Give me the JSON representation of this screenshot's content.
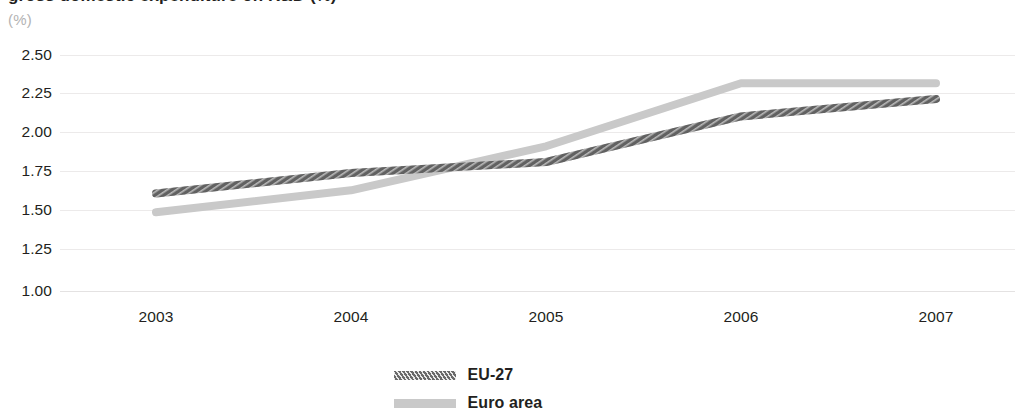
{
  "chart_data": {
    "type": "line",
    "title": "",
    "subtitle": "",
    "unit_label": "(%)",
    "xlabel": "",
    "ylabel": "",
    "categories": [
      "2003",
      "2004",
      "2005",
      "2006",
      "2007"
    ],
    "x_tick_labels": [
      "2003",
      "2004",
      "2005",
      "2006",
      "2007"
    ],
    "y_tick_labels": [
      "2.50",
      "2.25",
      "2.00",
      "1.75",
      "1.50",
      "1.25",
      "1.00"
    ],
    "y_tick_values": [
      2.5,
      2.25,
      2.0,
      1.75,
      1.5,
      1.25,
      1.0
    ],
    "ylim": [
      1.0,
      2.5
    ],
    "grid": true,
    "grid_axis": "y",
    "legend_position": "bottom-center",
    "series": [
      {
        "name": "EU-27",
        "color": "#6a6a6a",
        "style": "hatched",
        "values": [
          1.62,
          1.75,
          1.82,
          2.11,
          2.22
        ]
      },
      {
        "name": "Euro area",
        "color": "#c9c9c9",
        "style": "solid",
        "values": [
          1.5,
          1.64,
          1.92,
          2.32,
          2.32
        ]
      }
    ]
  },
  "header": {
    "title_cropped": "gross domestic expenditure on R&D (%)"
  },
  "legend": {
    "items": [
      {
        "label": "EU-27"
      },
      {
        "label": "Euro area"
      }
    ]
  }
}
